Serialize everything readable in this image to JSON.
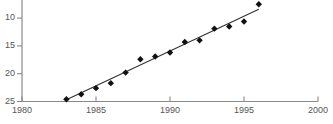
{
  "chart_data": {
    "type": "scatter",
    "title": "",
    "subtitle": "",
    "xlabel": "",
    "ylabel": "",
    "xlim": [
      1980,
      2000
    ],
    "ylim": [
      10,
      27.8
    ],
    "grid": false,
    "legend": null,
    "x_ticks": [
      1980,
      1985,
      1990,
      1995,
      2000
    ],
    "x_tick_labels": [
      "1980",
      "1985",
      "1990",
      "1995",
      "2000"
    ],
    "y_ticks": [
      10,
      15,
      20,
      25
    ],
    "y_tick_labels": [
      "10",
      "15",
      "20",
      "25"
    ],
    "marker": "diamond",
    "marker_color": "#111111",
    "axis_color": "#888888",
    "trendline_color": "#333333",
    "series": [
      {
        "name": "observations",
        "x": [
          1983,
          1984,
          1985,
          1986,
          1987,
          1988,
          1989,
          1990,
          1991,
          1992,
          1993,
          1994,
          1995,
          1996
        ],
        "y": [
          10.4,
          11.3,
          12.4,
          13.3,
          15.2,
          17.6,
          18.1,
          18.8,
          20.7,
          21.0,
          23.1,
          23.5,
          24.4,
          27.5
        ]
      }
    ],
    "trendline": {
      "name": "linear-fit",
      "x": [
        1983,
        1996
      ],
      "y": [
        10.3,
        26.6
      ]
    }
  },
  "axis_labels": {
    "y": [
      {
        "value": "25"
      },
      {
        "value": "20"
      },
      {
        "value": "15"
      },
      {
        "value": "10"
      }
    ],
    "x": [
      {
        "value": "1980"
      },
      {
        "value": "1985"
      },
      {
        "value": "1990"
      },
      {
        "value": "1995"
      },
      {
        "value": "2000"
      }
    ]
  }
}
